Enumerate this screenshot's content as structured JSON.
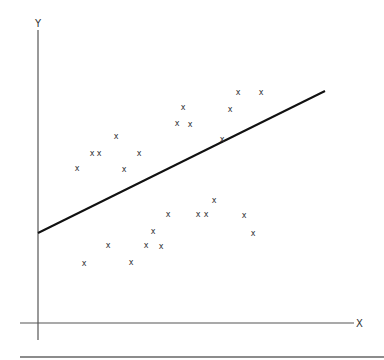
{
  "chart_data": {
    "type": "scatter",
    "title": "",
    "xlabel": "X",
    "ylabel": "Y",
    "grid": false,
    "legend": null,
    "marker": "x",
    "axis_pixels": {
      "y_axis": {
        "x": 38,
        "y_top": 30,
        "y_bottom": 340
      },
      "x_axis": {
        "y": 323,
        "x_left": 20,
        "x_right": 354
      },
      "bottom_rule": {
        "y": 357,
        "x_left": 20,
        "x_right": 384
      }
    },
    "points_pixels": [
      [
        77,
        168
      ],
      [
        92,
        153
      ],
      [
        99,
        153
      ],
      [
        116,
        136
      ],
      [
        124,
        169
      ],
      [
        139,
        153
      ],
      [
        177,
        123
      ],
      [
        183,
        107
      ],
      [
        190,
        124
      ],
      [
        222,
        139
      ],
      [
        230,
        109
      ],
      [
        238,
        92
      ],
      [
        261,
        92
      ],
      [
        84,
        263
      ],
      [
        108,
        245
      ],
      [
        131,
        262
      ],
      [
        146,
        245
      ],
      [
        153,
        231
      ],
      [
        161,
        246
      ],
      [
        168,
        214
      ],
      [
        198,
        214
      ],
      [
        206,
        214
      ],
      [
        214,
        200
      ],
      [
        244,
        215
      ],
      [
        253,
        233
      ]
    ],
    "regression_line_pixels": {
      "x1": 38,
      "y1": 233,
      "x2": 325,
      "y2": 91
    },
    "points_relative": [
      {
        "x": 39,
        "y": 155
      },
      {
        "x": 54,
        "y": 170
      },
      {
        "x": 61,
        "y": 170
      },
      {
        "x": 78,
        "y": 187
      },
      {
        "x": 86,
        "y": 154
      },
      {
        "x": 101,
        "y": 170
      },
      {
        "x": 139,
        "y": 200
      },
      {
        "x": 145,
        "y": 216
      },
      {
        "x": 152,
        "y": 199
      },
      {
        "x": 184,
        "y": 184
      },
      {
        "x": 192,
        "y": 214
      },
      {
        "x": 200,
        "y": 231
      },
      {
        "x": 223,
        "y": 231
      },
      {
        "x": 46,
        "y": 60
      },
      {
        "x": 70,
        "y": 78
      },
      {
        "x": 93,
        "y": 61
      },
      {
        "x": 108,
        "y": 78
      },
      {
        "x": 115,
        "y": 92
      },
      {
        "x": 123,
        "y": 77
      },
      {
        "x": 130,
        "y": 109
      },
      {
        "x": 160,
        "y": 109
      },
      {
        "x": 168,
        "y": 109
      },
      {
        "x": 176,
        "y": 123
      },
      {
        "x": 206,
        "y": 108
      },
      {
        "x": 215,
        "y": 90
      }
    ],
    "regression_line": {
      "intercept": 90,
      "slope": 0.495
    },
    "note": "Relative values are pixel offsets from the axis origin (38,323); no numeric tick labels are shown on the axes."
  },
  "labels": {
    "x_axis": "X",
    "y_axis": "Y",
    "marker_glyph": "x"
  },
  "colors": {
    "axis": "#555555",
    "line": "#111111",
    "marker": "#333333",
    "background": "#ffffff"
  }
}
